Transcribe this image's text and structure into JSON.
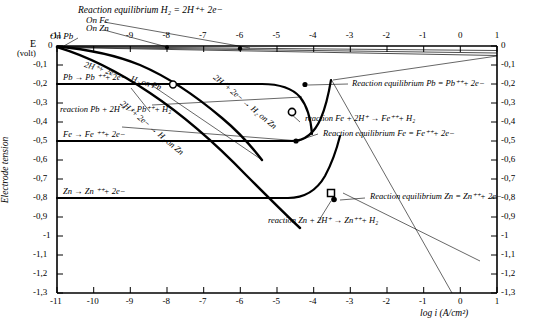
{
  "chart_data": {
    "type": "line",
    "title": "",
    "xlabel": "log i (A/cm²)",
    "ylabel": "Electrode tension",
    "ylabel_unit_top": "E",
    "ylabel_unit_bottom": "(volt)",
    "xlim": [
      -11,
      1
    ],
    "ylim": [
      -1.3,
      0
    ],
    "grid": false,
    "legend_position": "none",
    "x_ticks": [
      "-11",
      "-10",
      "-9",
      "-8",
      "-7",
      "-6",
      "-5",
      "-4",
      "-3",
      "-2",
      "-1",
      "0",
      "1"
    ],
    "x_ticks_top": [
      "-11",
      "-9",
      "-8",
      "-7",
      "-6",
      "-5",
      "-4",
      "-3",
      "-2",
      "-1",
      "0",
      "1"
    ],
    "y_ticks": [
      "0",
      "-0,1",
      "-0,2",
      "-0,3",
      "-0,4",
      "-0,5",
      "-0,6",
      "-0,7",
      "-0,8",
      "-0,9",
      "-1",
      "-1,1",
      "-1,2",
      "-1,3"
    ],
    "y_ticks_right": [
      "0",
      "-0,1",
      "-0,2",
      "-0,3",
      "-0,4",
      "-0,5",
      "-0,6",
      "-0,7",
      "-0,8",
      "-0,9",
      "-1",
      "-1,1",
      "-1,2",
      "-1,3"
    ],
    "series": [
      {
        "name": "Pb = Pb++ + 2e- equilibrium (horizontal)",
        "y": -0.2,
        "x": [
          -11,
          1
        ]
      },
      {
        "name": "Fe = Fe++ + 2e- equilibrium (horizontal)",
        "y": -0.5,
        "x": [
          -11,
          1
        ]
      },
      {
        "name": "Zn = Zn++ + 2e- equilibrium (horizontal)",
        "y": -0.8,
        "x": [
          -11,
          1
        ]
      },
      {
        "name": "H2 = 2H+ + 2e- equilibrium on Pb",
        "points": [
          [
            -11,
            0
          ],
          [
            1,
            -0.02
          ]
        ]
      },
      {
        "name": "H2 = 2H+ + 2e- equilibrium on Zn",
        "points": [
          [
            -11,
            0
          ],
          [
            1,
            -0.03
          ]
        ]
      },
      {
        "name": "H2 = 2H+ + 2e- equilibrium on Fe",
        "points": [
          [
            -11,
            0
          ],
          [
            1,
            -0.04
          ]
        ]
      },
      {
        "name": "2H+ + 2e- -> H2 on Pb (cathodic)",
        "points": [
          [
            -11,
            0
          ],
          [
            -9,
            -0.07
          ],
          [
            -8,
            -0.12
          ],
          [
            -7,
            -0.19
          ],
          [
            -6,
            -0.27
          ],
          [
            -5,
            -0.38
          ],
          [
            -4,
            -0.52
          ],
          [
            -3.4,
            -0.62
          ]
        ]
      },
      {
        "name": "2H+ + 2e- -> H2 on Zn (cathodic)",
        "points": [
          [
            -11,
            0.0
          ],
          [
            -9,
            -0.14
          ],
          [
            -7,
            -0.38
          ],
          [
            -5.5,
            -0.56
          ],
          [
            -4.3,
            -0.72
          ],
          [
            -3.6,
            -0.81
          ],
          [
            -3.0,
            -0.89
          ]
        ]
      },
      {
        "name": "Pb -> Pb++ + 2e- (anodic)",
        "points": [
          [
            -11,
            -0.2
          ],
          [
            -6,
            -0.2
          ],
          [
            -4.6,
            -0.2
          ],
          [
            -3.9,
            -0.24
          ],
          [
            -3.4,
            -0.33
          ],
          [
            -3.1,
            -0.45
          ],
          [
            -3.0,
            -0.55
          ]
        ]
      },
      {
        "name": "Fe -> Fe++ + 2e- (anodic)",
        "points": [
          [
            -11,
            -0.5
          ],
          [
            -6,
            -0.5
          ],
          [
            -4.6,
            -0.5
          ],
          [
            -4.0,
            -0.46
          ],
          [
            -3.5,
            -0.38
          ],
          [
            -3.2,
            -0.3
          ],
          [
            -3.05,
            -0.22
          ]
        ]
      },
      {
        "name": "Zn -> Zn++ + 2e- (anodic)",
        "points": [
          [
            -11,
            -0.8
          ],
          [
            -6,
            -0.8
          ],
          [
            -4.4,
            -0.8
          ],
          [
            -3.9,
            -0.79
          ],
          [
            -3.5,
            -0.74
          ],
          [
            -3.2,
            -0.64
          ],
          [
            -3.05,
            -0.52
          ],
          [
            -2.95,
            -0.4
          ]
        ]
      }
    ],
    "markers": [
      {
        "label": "Pb corrosion point",
        "shape": "open-circle",
        "x": -7.85,
        "y": -0.205
      },
      {
        "label": "Pb/Fe crossing point",
        "shape": "filled-dot",
        "x": -3.95,
        "y": -0.205
      },
      {
        "label": "Fe corrosion point",
        "shape": "open-circle",
        "x": -4.6,
        "y": -0.272
      },
      {
        "label": "Fe equilibrium point",
        "shape": "filled-dot",
        "x": -4.55,
        "y": -0.503
      },
      {
        "label": "Zn corrosion point",
        "shape": "open-square",
        "x": -3.55,
        "y": -0.757
      },
      {
        "label": "Zn equilibrium point",
        "shape": "filled-dot",
        "x": -3.4,
        "y": -0.807
      },
      {
        "label": "H2 on Pb tick point",
        "shape": "filled-dot",
        "x": -6.0,
        "y": -0.01
      },
      {
        "label": "H2 on Zn tick point",
        "shape": "filled-dot",
        "x": -8.0,
        "y": -0.005
      }
    ],
    "annotations": [
      {
        "id": "eq_h2",
        "text": "Reaction equilibrium H₂ = 2H⁺+ 2e−"
      },
      {
        "id": "on_fe",
        "text": "On Fe"
      },
      {
        "id": "on_zn",
        "text": "On Zn"
      },
      {
        "id": "on_pb",
        "text": "On Pb"
      },
      {
        "id": "cath_pb",
        "text": "2H⁺+ 2e− → H₂ on Pb"
      },
      {
        "id": "cath_zn",
        "text": "2H⁺+ 2e− → H₂ on Zn"
      },
      {
        "id": "an_pb",
        "text": "Pb → Pb ⁺⁺+ 2e−"
      },
      {
        "id": "an_fe",
        "text": "Fe → Fe ⁺⁺+ 2e−"
      },
      {
        "id": "an_zn",
        "text": "Zn → Zn ⁺⁺+ 2e−"
      },
      {
        "id": "rx_pb",
        "text": "reaction Pb + 2H⁺ → Pb⁺⁺+ H₂"
      },
      {
        "id": "rx_fe",
        "text": "reaction Fe + 2H⁺ → Fe⁺⁺+ H₂"
      },
      {
        "id": "rx_zn",
        "text": "reaction Zn + 2H⁺ → Zn⁺⁺+ H₂"
      },
      {
        "id": "eq_pb",
        "text": "Reaction equilibrium Pb = Pb⁺⁺+ 2e−"
      },
      {
        "id": "eq_fe",
        "text": "Reaction equilibrium Fe = Fe⁺⁺+ 2e−"
      },
      {
        "id": "eq_zn",
        "text": "Reaction equilibrium Zn = Zn⁺⁺+ 2e−"
      }
    ]
  }
}
